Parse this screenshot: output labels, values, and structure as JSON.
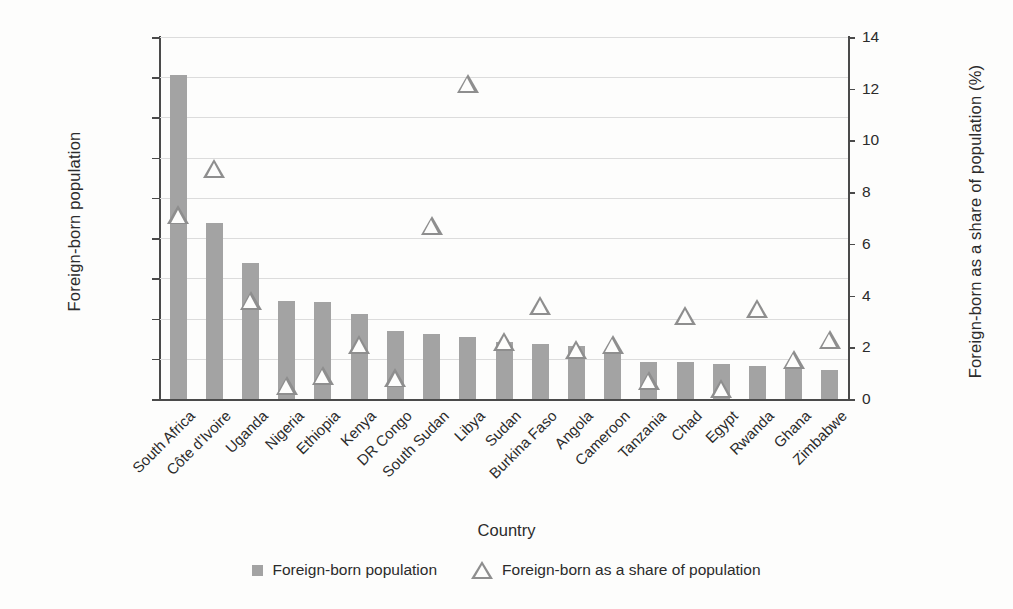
{
  "chart_data": {
    "type": "bar",
    "title": "",
    "xlabel": "Country",
    "ylabel": "Foreign-born  population",
    "y2label": "Foreign-born as a share of population (%)",
    "ylim": [
      0,
      4500000
    ],
    "y2lim": [
      0,
      14
    ],
    "ytick_labels": [
      "4,500,000",
      "4,000,000",
      "3,500,000",
      "3,000,000",
      "2,500,000",
      "2,000,000",
      "1,500,000",
      "1,000,000",
      "500,000",
      "0"
    ],
    "ytick_values": [
      4500000,
      4000000,
      3500000,
      3000000,
      2500000,
      2000000,
      1500000,
      1000000,
      500000,
      0
    ],
    "y2tick_labels": [
      "14",
      "12",
      "10",
      "8",
      "6",
      "4",
      "2",
      "0"
    ],
    "y2tick_values": [
      14,
      12,
      10,
      8,
      6,
      4,
      2,
      0
    ],
    "grid": true,
    "legend_position": "bottom-center",
    "categories": [
      "South Africa",
      "Côte d'Ivoire",
      "Uganda",
      "Nigeria",
      "Ethiopia",
      "Kenya",
      "DR Congo",
      "South Sudan",
      "Libya",
      "Sudan",
      "Burkina Faso",
      "Angola",
      "Cameroon",
      "Tanzania",
      "Chad",
      "Egypt",
      "Rwanda",
      "Ghana",
      "Zimbabwe"
    ],
    "series": [
      {
        "name": "Foreign-born population",
        "axis": "left",
        "marker": "bar",
        "color": "#a3a3a3",
        "values": [
          4030000,
          2190000,
          1690000,
          1220000,
          1210000,
          1060000,
          850000,
          810000,
          770000,
          710000,
          690000,
          660000,
          590000,
          460000,
          460000,
          440000,
          410000,
          400000,
          360000
        ]
      },
      {
        "name": "Foreign-born as a share of population",
        "axis": "right",
        "marker": "triangle",
        "color": "#8e8e8e",
        "values": [
          7.1,
          8.9,
          3.8,
          0.5,
          0.9,
          2.1,
          0.8,
          6.7,
          12.2,
          2.2,
          3.6,
          1.9,
          2.1,
          0.7,
          3.2,
          0.4,
          3.5,
          1.5,
          2.3
        ]
      }
    ]
  },
  "legend": {
    "items": [
      {
        "label": "Foreign-born population",
        "marker": "square"
      },
      {
        "label": "Foreign-born as a share of population",
        "marker": "triangle"
      }
    ]
  }
}
